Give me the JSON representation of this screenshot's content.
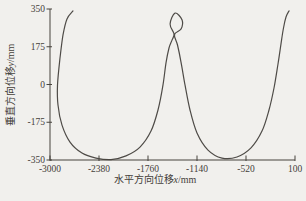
{
  "figure": {
    "background": "#f1f0ed",
    "axis_color": "#47433c",
    "text_color": "#45413a",
    "curve_color": "#4e4b47"
  },
  "chart_data": {
    "type": "line",
    "title": "",
    "xlabel_prefix": "水平方向位移",
    "xlabel_var": "x",
    "xlabel_suffix": "/mm",
    "ylabel_prefix": "垂直方向位移",
    "ylabel_var": "y",
    "ylabel_suffix": "/mm",
    "xlim": [
      -3000,
      100
    ],
    "ylim": [
      -350,
      350
    ],
    "x_ticks": [
      -3000,
      -2380,
      -1760,
      -1140,
      -520,
      100
    ],
    "x_tick_labels": [
      "-3000",
      "-2380",
      "-1760",
      "-1140",
      "-520",
      "100"
    ],
    "y_ticks": [
      350,
      175,
      0,
      -175,
      -350
    ],
    "y_tick_labels": [
      "350",
      "175",
      "0",
      "-175",
      "-350"
    ],
    "grid": false,
    "legend": null,
    "series_name": "displacement-trajectory",
    "points": [
      [
        -2709,
        341
      ],
      [
        -2785,
        304
      ],
      [
        -2835,
        230
      ],
      [
        -2873,
        123
      ],
      [
        -2905,
        -2
      ],
      [
        -2899,
        -95
      ],
      [
        -2848,
        -188
      ],
      [
        -2747,
        -267
      ],
      [
        -2595,
        -318
      ],
      [
        -2418,
        -341
      ],
      [
        -2228,
        -348
      ],
      [
        -2038,
        -331
      ],
      [
        -1861,
        -290
      ],
      [
        -1722,
        -216
      ],
      [
        -1633,
        -118
      ],
      [
        -1570,
        -2
      ],
      [
        -1532,
        100
      ],
      [
        -1494,
        169
      ],
      [
        -1456,
        206
      ],
      [
        -1431,
        234
      ],
      [
        -1481,
        280
      ],
      [
        -1418,
        331
      ],
      [
        -1329,
        299
      ],
      [
        -1342,
        257
      ],
      [
        -1425,
        232
      ],
      [
        -1387,
        183
      ],
      [
        -1342,
        104
      ],
      [
        -1292,
        -2
      ],
      [
        -1228,
        -118
      ],
      [
        -1140,
        -225
      ],
      [
        -1001,
        -304
      ],
      [
        -824,
        -341
      ],
      [
        -634,
        -336
      ],
      [
        -457,
        -294
      ],
      [
        -318,
        -216
      ],
      [
        -229,
        -118
      ],
      [
        -166,
        -16
      ],
      [
        -115,
        95
      ],
      [
        -77,
        188
      ],
      [
        -46,
        262
      ],
      [
        -14,
        313
      ],
      [
        24,
        341
      ]
    ]
  }
}
